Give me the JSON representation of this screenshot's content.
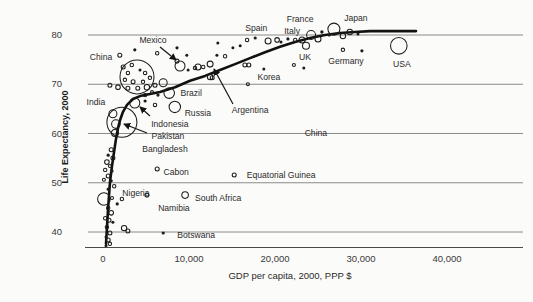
{
  "figure": {
    "background": "#fbfbf9",
    "ink": "#1c1c1c",
    "grid_color": "#6e6e6e"
  },
  "chart_data": {
    "type": "scatter",
    "title": "",
    "xlabel": "GDP per capita, 2000, PPP $",
    "ylabel": "Life Expectancy, 2000",
    "xlim": [
      0,
      48800
    ],
    "ylim": [
      36,
      83
    ],
    "xticks": [
      {
        "value": 0,
        "label": "0"
      },
      {
        "value": 10000,
        "label": "10,000"
      },
      {
        "value": 20000,
        "label": "20,000"
      },
      {
        "value": 30000,
        "label": "30,000"
      },
      {
        "value": 40000,
        "label": "40,000"
      }
    ],
    "yticks": [
      {
        "value": 40,
        "label": "40"
      },
      {
        "value": 50,
        "label": "50"
      },
      {
        "value": 60,
        "label": "60"
      },
      {
        "value": 70,
        "label": "70"
      },
      {
        "value": 80,
        "label": "80"
      }
    ],
    "grid": "horizontal",
    "legend": null,
    "labeled_points": [
      {
        "name": "China",
        "gdp": 3950,
        "le": 71.5,
        "r": 17,
        "label_dx": -36,
        "label_dy": -20
      },
      {
        "name": "India",
        "gdp": 2200,
        "le": 62.3,
        "r": 15,
        "label_dx": -26,
        "label_dy": -20
      },
      {
        "name": "USA",
        "gdp": 34400,
        "le": 77.8,
        "r": 8.3,
        "label_dx": 3,
        "label_dy": 18
      },
      {
        "name": "Japan",
        "gdp": 26850,
        "le": 81.2,
        "r": 6,
        "label_dx": 22,
        "label_dy": -11
      },
      {
        "name": "Nigeria",
        "gdp": 100,
        "le": 46.7,
        "r": 6.3,
        "label_dx": 32,
        "label_dy": -6
      },
      {
        "name": "Russia",
        "gdp": 8350,
        "le": 65.4,
        "r": 5.7,
        "label_dx": 23,
        "label_dy": 6
      },
      {
        "name": "Brazil",
        "gdp": 7700,
        "le": 68.2,
        "r": 5.3,
        "label_dx": 22,
        "label_dy": 0
      },
      {
        "name": "Mexico",
        "gdp": 8950,
        "le": 73.7,
        "r": 5,
        "label_dx": -27,
        "label_dy": -26,
        "arrow": [
          160,
          47,
          176,
          60
        ]
      },
      {
        "name": "Indonesia",
        "gdp": 3700,
        "le": 66.2,
        "r": 5,
        "label_dx": 35,
        "label_dy": 21,
        "arrow": [
          150,
          116,
          140,
          107
        ]
      },
      {
        "name": "France",
        "gdp": 24200,
        "le": 80.0,
        "r": 4.5,
        "label_dx": -11,
        "label_dy": -16
      },
      {
        "name": "Pakistan",
        "gdp": 1500,
        "le": 61.9,
        "r": 4.3,
        "label_dx": 52,
        "label_dy": 12,
        "arrow": [
          147,
          133,
          124,
          124
        ]
      },
      {
        "name": "Bangladesh",
        "gdp": 1400,
        "le": 60.1,
        "r": 3.5,
        "label_dx": 50,
        "label_dy": 16
      },
      {
        "name": "UK",
        "gdp": 23600,
        "le": 77.8,
        "r": 3.5,
        "label_dx": -1,
        "label_dy": 11
      },
      {
        "name": "South Africa",
        "gdp": 9550,
        "le": 47.5,
        "r": 3.3,
        "label_dx": 33,
        "label_dy": 3
      },
      {
        "name": "Argentina",
        "gdp": 12450,
        "le": 74.1,
        "r": 3,
        "label_dx": 40,
        "label_dy": 46,
        "arrow": [
          233,
          104,
          214,
          69
        ]
      },
      {
        "name": "Italy",
        "gdp": 23150,
        "le": 79.0,
        "r": 3,
        "label_dx": -10,
        "label_dy": -9
      },
      {
        "name": "Namibia",
        "gdp": 5100,
        "le": 47.5,
        "r": 2,
        "label_dx": 27,
        "label_dy": 13
      },
      {
        "name": "Cabon",
        "gdp": 6300,
        "le": 52.8,
        "r": 2,
        "label_dx": 19,
        "label_dy": 3
      },
      {
        "name": "Equatorial Guinea",
        "gdp": 15250,
        "le": 51.6,
        "r": 2,
        "label_dx": 47,
        "label_dy": 0
      },
      {
        "name": "Germany",
        "gdp": 27900,
        "le": 77.0,
        "r": 1.7,
        "label_dx": 3,
        "label_dy": 11
      },
      {
        "name": "Korea",
        "gdp": 16850,
        "le": 70.0,
        "r": 1.5,
        "label_dx": 21,
        "label_dy": -7
      },
      {
        "name": "Spain",
        "gdp": 17700,
        "le": 79.4,
        "r": 1.3,
        "label_dx": 1,
        "label_dy": -10
      },
      {
        "name": "Botswana",
        "gdp": 7000,
        "le": 39.8,
        "r": 1.3,
        "label_dx": 33,
        "label_dy": 2
      }
    ],
    "annotations": [
      {
        "text": "China",
        "gdp": 24750,
        "le": 60.1
      }
    ],
    "unlabeled_points": [
      [
        13350,
        78.4,
        1.2
      ],
      [
        13250,
        75.9,
        1.2
      ],
      [
        14200,
        75.7,
        1.7
      ],
      [
        15100,
        77.4,
        1.2
      ],
      [
        15950,
        77.8,
        1.2
      ],
      [
        16500,
        73.9,
        2.0
      ],
      [
        16750,
        79.0,
        1.7
      ],
      [
        19200,
        78.8,
        3.0
      ],
      [
        20250,
        79.0,
        2.3
      ],
      [
        20700,
        78.6,
        1.2
      ],
      [
        21500,
        79.2,
        1.3
      ],
      [
        22350,
        79.0,
        1.7
      ],
      [
        25000,
        79.2,
        3.0
      ],
      [
        25450,
        80.6,
        1.4
      ],
      [
        26300,
        80.0,
        1.3
      ],
      [
        27900,
        79.8,
        2.7
      ],
      [
        28700,
        80.6,
        2.7
      ],
      [
        29650,
        80.2,
        1.2
      ],
      [
        30100,
        76.8,
        1.3
      ],
      [
        22200,
        73.9,
        1.5
      ],
      [
        23350,
        73.3,
        1.2
      ],
      [
        16950,
        73.9,
        2.0
      ],
      [
        18700,
        73.1,
        1.2
      ],
      [
        11050,
        73.5,
        3.0
      ],
      [
        12450,
        71.5,
        2.7
      ],
      [
        10700,
        73.3,
        1.7
      ],
      [
        11650,
        73.5,
        1.7
      ],
      [
        9900,
        72.9,
        1.2
      ],
      [
        9750,
        75.9,
        1.2
      ],
      [
        8600,
        74.7,
        2.0
      ],
      [
        8600,
        77.4,
        1.3
      ],
      [
        6300,
        76.3,
        1.7
      ],
      [
        3700,
        77.0,
        1.3
      ],
      [
        1950,
        75.9,
        2.0
      ],
      [
        2350,
        73.5,
        2.0
      ],
      [
        3350,
        73.9,
        1.7
      ],
      [
        4300,
        72.9,
        1.2
      ],
      [
        2900,
        72.3,
        1.7
      ],
      [
        4900,
        72.3,
        1.7
      ],
      [
        2550,
        70.9,
        1.7
      ],
      [
        3500,
        70.5,
        2.0
      ],
      [
        4650,
        70.5,
        1.7
      ],
      [
        5450,
        71.3,
        1.7
      ],
      [
        800,
        69.8,
        2.0
      ],
      [
        1750,
        69.4,
        2.3
      ],
      [
        2900,
        69.2,
        2.0
      ],
      [
        4050,
        69.2,
        2.0
      ],
      [
        5100,
        69.4,
        2.7
      ],
      [
        6050,
        69.8,
        2.0
      ],
      [
        7000,
        70.3,
        4.0
      ],
      [
        5700,
        68.4,
        1.5
      ],
      [
        6400,
        67.8,
        1.3
      ],
      [
        4900,
        67.8,
        1.7
      ],
      [
        6050,
        65.8,
        1.7
      ],
      [
        4900,
        66.6,
        1.3
      ],
      [
        12700,
        71.3,
        2.0
      ],
      [
        1150,
        64.0,
        4.0
      ],
      [
        950,
        56.7,
        2.0
      ],
      [
        600,
        55.6,
        1.3
      ],
      [
        1150,
        55.0,
        2.0
      ],
      [
        450,
        54.2,
        2.3
      ],
      [
        800,
        53.4,
        1.5
      ],
      [
        250,
        52.6,
        1.7
      ],
      [
        1050,
        52.4,
        1.3
      ],
      [
        600,
        51.4,
        2.0
      ],
      [
        100,
        50.6,
        1.5
      ],
      [
        950,
        50.4,
        1.3
      ],
      [
        1300,
        49.3,
        1.7
      ],
      [
        600,
        48.7,
        1.3
      ],
      [
        1050,
        46.9,
        1.5
      ],
      [
        2200,
        46.7,
        1.7
      ],
      [
        1650,
        45.7,
        1.3
      ],
      [
        600,
        44.9,
        1.7
      ],
      [
        950,
        43.9,
        2.3
      ],
      [
        250,
        42.8,
        1.7
      ],
      [
        700,
        42.4,
        2.0
      ],
      [
        1150,
        42.0,
        1.2
      ],
      [
        450,
        41.0,
        1.7
      ],
      [
        2450,
        40.8,
        2.7
      ],
      [
        800,
        39.8,
        2.0
      ],
      [
        2900,
        40.2,
        2.0
      ],
      [
        350,
        39.0,
        1.2
      ],
      [
        600,
        38.4,
        2.0
      ],
      [
        800,
        37.6,
        1.7
      ],
      [
        350,
        37.2,
        1.2
      ]
    ],
    "trend": [
      [
        350,
        37.6
      ],
      [
        450,
        40.6
      ],
      [
        580,
        44.5
      ],
      [
        810,
        50.2
      ],
      [
        1050,
        53.4
      ],
      [
        1280,
        56.2
      ],
      [
        1510,
        58.9
      ],
      [
        1740,
        61.1
      ],
      [
        1980,
        62.7
      ],
      [
        2330,
        64.4
      ],
      [
        2790,
        65.8
      ],
      [
        3490,
        67.0
      ],
      [
        4300,
        67.6
      ],
      [
        5470,
        68.0
      ],
      [
        6630,
        68.4
      ],
      [
        8370,
        69.4
      ],
      [
        10120,
        70.7
      ],
      [
        11860,
        71.7
      ],
      [
        13600,
        72.9
      ],
      [
        15350,
        74.1
      ],
      [
        17090,
        75.3
      ],
      [
        18840,
        76.5
      ],
      [
        20580,
        77.6
      ],
      [
        22330,
        78.6
      ],
      [
        24070,
        79.4
      ],
      [
        25810,
        80.0
      ],
      [
        27560,
        80.4
      ],
      [
        29300,
        80.6
      ],
      [
        31050,
        80.8
      ],
      [
        33950,
        80.8
      ],
      [
        36400,
        80.8
      ]
    ]
  }
}
